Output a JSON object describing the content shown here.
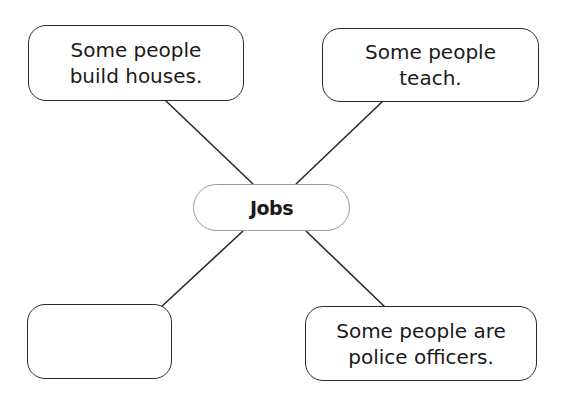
{
  "diagram": {
    "type": "word-web",
    "center": {
      "label": "Jobs"
    },
    "nodes": [
      {
        "position": "top-left",
        "text": "Some people\nbuild houses."
      },
      {
        "position": "top-right",
        "text": "Some people\nteach."
      },
      {
        "position": "bottom-left",
        "text": ""
      },
      {
        "position": "bottom-right",
        "text": "Some people are\npolice officers."
      }
    ],
    "colors": {
      "line": "#2a2a2a",
      "center_border": "#9a9a9a",
      "background": "#ffffff"
    }
  }
}
